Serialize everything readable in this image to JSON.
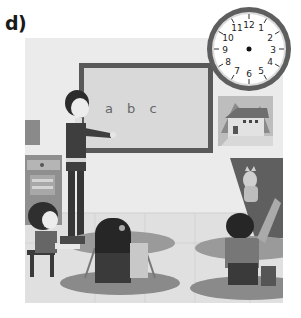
{
  "exercise": {
    "label": "d)"
  },
  "scene": {
    "description": "classroom illustration",
    "board": {
      "text": "a b c"
    },
    "clock": {
      "numbers": [
        "12",
        "1",
        "2",
        "3",
        "4",
        "5",
        "6",
        "7",
        "8",
        "9",
        "10",
        "11"
      ],
      "hands": "none"
    },
    "wall_picture": "house"
  },
  "colors": {
    "scene_bg": "#e9e9e9",
    "board_frame": "#5a5a5a",
    "board_fill": "#d8d8d8",
    "clock_rim": "#6a6a6a",
    "floor": "#e2e2e2"
  }
}
